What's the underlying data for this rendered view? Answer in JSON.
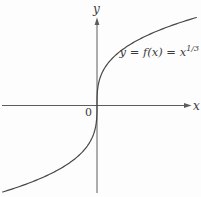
{
  "figure": {
    "cropped_fragment": "= n"
  },
  "chart_data": {
    "type": "line",
    "title": "",
    "function": "y = x^(1/3)",
    "curve_label": {
      "main": "y = f(x) = x",
      "sup": "1/3"
    },
    "axis_labels": {
      "x": "x",
      "y": "y"
    },
    "origin_label": "0",
    "x_range": [
      -5,
      5
    ],
    "y_range": [
      -4.7,
      4.7
    ],
    "grid": false,
    "tick_labels": [],
    "legend": "none",
    "colors": {
      "curve": "#474747",
      "axis": "#5c5c5c",
      "text": "#3a3a3a",
      "background": "#fdfdfd"
    },
    "layout": {
      "origin_px": [
        97,
        105.5
      ],
      "k": 19,
      "dy_min": -86.5,
      "dy_max": 88,
      "samples": 220
    }
  }
}
